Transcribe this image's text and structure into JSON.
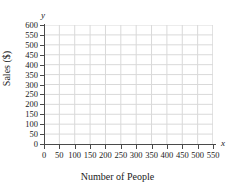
{
  "chart_data": {
    "type": "scatter",
    "title": "",
    "subtitle": "",
    "xlabel": "Number of People",
    "ylabel": "Sales ($)",
    "x_axis_marker": "x",
    "y_axis_marker": "y",
    "xlim": [
      0,
      550
    ],
    "ylim": [
      0,
      600
    ],
    "x_tick_step": 50,
    "y_tick_step": 50,
    "x_ticks": [
      0,
      50,
      100,
      150,
      200,
      250,
      300,
      350,
      400,
      450,
      500,
      550
    ],
    "y_ticks": [
      0,
      50,
      100,
      150,
      200,
      250,
      300,
      350,
      400,
      450,
      500,
      550,
      600
    ],
    "x_tick_labels": [
      "0",
      "50",
      "100",
      "150",
      "200",
      "250",
      "300",
      "350",
      "400",
      "450",
      "500",
      "550"
    ],
    "y_tick_labels": [
      "0",
      "50",
      "100",
      "150",
      "200",
      "250",
      "300",
      "350",
      "400",
      "450",
      "500",
      "550",
      "600"
    ],
    "series": [],
    "values": [],
    "annotations": [],
    "legend": null,
    "legend_position": "none",
    "grid": true,
    "grid_color": "#d9d9d9",
    "axis_color": "#4a4a4a",
    "background_color": "#ffffff"
  }
}
